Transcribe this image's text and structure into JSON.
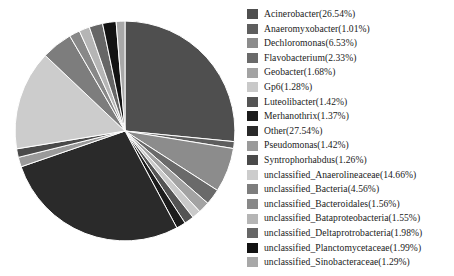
{
  "chart_data": {
    "type": "pie",
    "title": "",
    "subtitle": "",
    "xlabel": "",
    "ylabel": "",
    "legend_position": "right",
    "grid": false,
    "start_angle_deg": 0,
    "direction": "clockwise",
    "units": "percent",
    "categories": [
      "Acinerobacter",
      "Anaeromyxobacter",
      "Dechloromonas",
      "Flavobacterium",
      "Geobacter",
      "Gp6",
      "Luteolibacter",
      "Merhanothrix",
      "Other",
      "Pseudomonas",
      "Syntrophorhabdus",
      "unclassified_Anaerolineaceae",
      "unclassified_Bacteria",
      "unclassified_Bacteroidales",
      "unclassified_Bataproteobacteria",
      "unclassified_Deltaprotrobacteria",
      "unclassified_Planctomycetaceae",
      "unclassified_Sinobacteraceae"
    ],
    "values": [
      26.54,
      1.01,
      6.53,
      2.33,
      1.68,
      1.28,
      1.42,
      1.37,
      27.54,
      1.42,
      1.26,
      14.66,
      4.56,
      1.56,
      1.55,
      1.98,
      1.99,
      1.29
    ],
    "colors": [
      "#4f4f4f",
      "#5e5e5e",
      "#8c8c8c",
      "#6a6a6a",
      "#a3a3a3",
      "#c9c9c9",
      "#545454",
      "#1c1c1c",
      "#2a2a2a",
      "#9a9a9a",
      "#4a4a4a",
      "#cccccc",
      "#7d7d7d",
      "#888888",
      "#b5b5b5",
      "#666666",
      "#121212",
      "#a8a8a8"
    ]
  },
  "legend": {
    "items": [
      {
        "label": "Acinerobacter(26.54%)",
        "color": "#4f4f4f",
        "name": "acinerobacter"
      },
      {
        "label": "Anaeromyxobacter(1.01%)",
        "color": "#5e5e5e",
        "name": "anaeromyxobacter"
      },
      {
        "label": "Dechloromonas(6.53%)",
        "color": "#8c8c8c",
        "name": "dechloromonas"
      },
      {
        "label": "Flavobacterium(2.33%)",
        "color": "#6a6a6a",
        "name": "flavobacterium"
      },
      {
        "label": "Geobacter(1.68%)",
        "color": "#a3a3a3",
        "name": "geobacter"
      },
      {
        "label": "Gp6(1.28%)",
        "color": "#c9c9c9",
        "name": "gp6"
      },
      {
        "label": "Luteolibacter(1.42%)",
        "color": "#545454",
        "name": "luteolibacter"
      },
      {
        "label": "Merhanothrix(1.37%)",
        "color": "#1c1c1c",
        "name": "merhanothrix"
      },
      {
        "label": "Other(27.54%)",
        "color": "#2a2a2a",
        "name": "other"
      },
      {
        "label": "Pseudomonas(1.42%)",
        "color": "#9a9a9a",
        "name": "pseudomonas"
      },
      {
        "label": "Syntrophorhabdus(1.26%)",
        "color": "#4a4a4a",
        "name": "syntrophorhabdus"
      },
      {
        "label": "unclassified_Anaerolineaceae(14.66%)",
        "color": "#cccccc",
        "name": "unclassified-anaerolineaceae"
      },
      {
        "label": "unclassified_Bacteria(4.56%)",
        "color": "#7d7d7d",
        "name": "unclassified-bacteria"
      },
      {
        "label": "unclassified_Bacteroidales(1.56%)",
        "color": "#888888",
        "name": "unclassified-bacteroidales"
      },
      {
        "label": "unclassified_Bataproteobacteria(1.55%)",
        "color": "#b5b5b5",
        "name": "unclassified-bataproteobacteria"
      },
      {
        "label": "unclassified_Deltaprotrobacteria(1.98%)",
        "color": "#666666",
        "name": "unclassified-deltaprotrobacteria"
      },
      {
        "label": "unclassified_Planctomycetaceae(1.99%)",
        "color": "#121212",
        "name": "unclassified-planctomycetaceae"
      },
      {
        "label": "unclassified_Sinobacteraceae(1.29%)",
        "color": "#a8a8a8",
        "name": "unclassified-sinobacteraceae"
      }
    ]
  }
}
